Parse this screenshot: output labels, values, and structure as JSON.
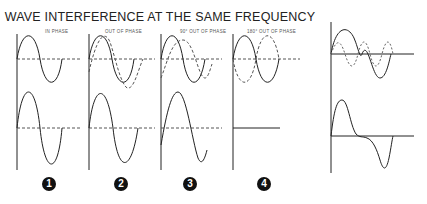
{
  "title": "WAVE INTERFERENCE AT THE SAME FREQUENCY",
  "panels": [
    {
      "label": "IN PHASE",
      "number": "1",
      "result": "constructive (double amplitude)"
    },
    {
      "label": "OUT OF PHASE",
      "number": "2",
      "result": "partially shifted sum"
    },
    {
      "label": "90° OUT OF PHASE",
      "number": "3",
      "result": "reduced amplitude, shifted"
    },
    {
      "label": "180° OUT OF PHASE",
      "number": "4",
      "result": "cancellation (flat line)"
    }
  ],
  "side_panel": {
    "description": "Two waves of different frequency and resulting summed waveform"
  },
  "colors": {
    "line": "#222222",
    "dashed": "#555555",
    "background": "#ffffff"
  }
}
